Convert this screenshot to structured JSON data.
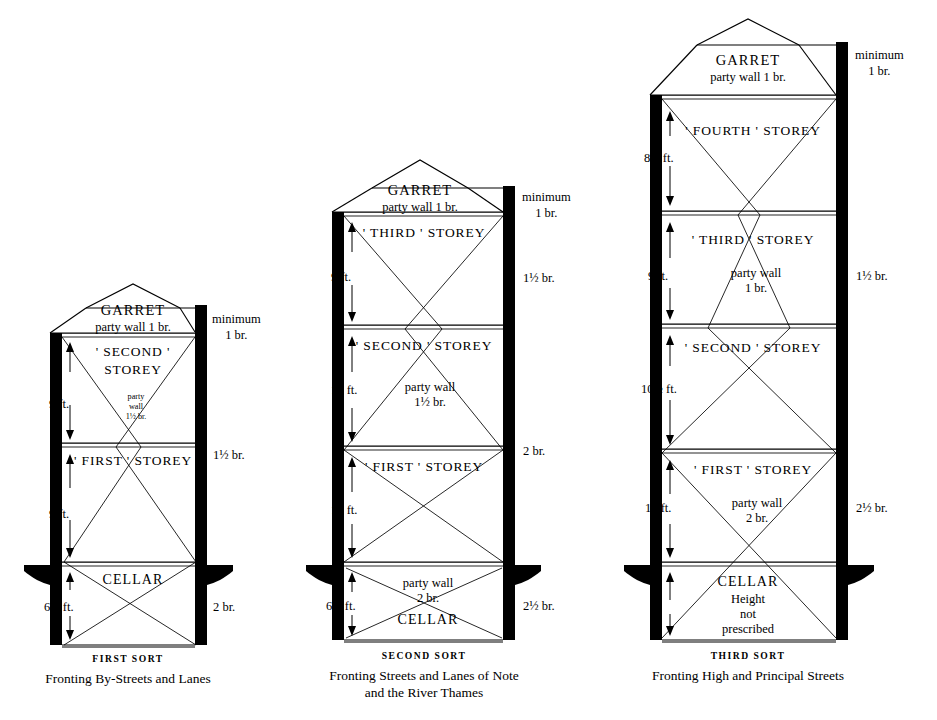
{
  "plate": {
    "title": "Sections of party walls under the Building Act — three sorts of house",
    "background": "#ffffff",
    "ink": "#000000"
  },
  "figures": [
    {
      "id": "first-sort",
      "sort_label": "FIRST SORT",
      "caption": "Fronting By-Streets and Lanes",
      "storeys": [
        {
          "name": "GARRET",
          "sub": "party wall 1 br.",
          "height": ""
        },
        {
          "name": "' SECOND '",
          "name2": "STOREY",
          "height": "9 ft."
        },
        {
          "name": "' FIRST '  STOREY",
          "height": "9 ft."
        },
        {
          "name": "CELLAR",
          "height": "6½ ft."
        }
      ],
      "party_wall_note": {
        "l1": "party",
        "l2": "wall",
        "l3": "1½ br."
      },
      "right_labels": [
        {
          "text": "minimum",
          "text2": "1 br."
        },
        {
          "text": "1½ br."
        },
        {
          "text": "2 br."
        }
      ]
    },
    {
      "id": "second-sort",
      "sort_label": "SECOND SORT",
      "caption_line1": "Fronting Streets and Lanes of Note",
      "caption_line2": "and the River Thames",
      "storeys": [
        {
          "name": "GARRET",
          "sub": "party wall 1 br.",
          "height": ""
        },
        {
          "name": "' THIRD '  STOREY",
          "height": "9 ft."
        },
        {
          "name": "' SECOND '  STOREY",
          "height": "10 ft."
        },
        {
          "name": "' FIRST '  STOREY",
          "height": "10 ft."
        },
        {
          "name": "CELLAR",
          "height": "6½ ft."
        }
      ],
      "party_wall_note": {
        "l1": "party wall",
        "l2": "1½ br."
      },
      "cellar_note": {
        "l1": "party wall",
        "l2": "2 br."
      },
      "right_labels": [
        {
          "text": "minimum",
          "text2": "1 br."
        },
        {
          "text": "1½ br."
        },
        {
          "text": "2 br."
        },
        {
          "text": "2½ br."
        }
      ]
    },
    {
      "id": "third-sort",
      "sort_label": "THIRD SORT",
      "caption": "Fronting High and Principal Streets",
      "storeys": [
        {
          "name": "GARRET",
          "sub": "party wall 1 br.",
          "height": ""
        },
        {
          "name": "' FOURTH '  STOREY",
          "height": "8½ ft."
        },
        {
          "name": "' THIRD '  STOREY",
          "height": "9 ft."
        },
        {
          "name": "' SECOND '  STOREY",
          "height": "10½ ft."
        },
        {
          "name": "' FIRST '  STOREY",
          "height": "10 ft."
        },
        {
          "name": "CELLAR",
          "sub1": "Height",
          "sub2": "not",
          "sub3": "prescribed"
        }
      ],
      "party_wall_note_upper": {
        "l1": "party wall",
        "l2": "1 br."
      },
      "party_wall_note_lower": {
        "l1": "party wall",
        "l2": "2 br."
      },
      "right_labels": [
        {
          "text": "minimum",
          "text2": "1 br."
        },
        {
          "text": "1½ br."
        },
        {
          "text": "2½ br."
        }
      ]
    }
  ]
}
